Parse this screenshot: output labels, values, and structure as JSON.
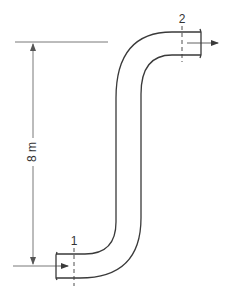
{
  "diagram": {
    "type": "pipe-elevation",
    "elevation_label": "8 m",
    "sections": [
      {
        "id": "inlet",
        "label": "1"
      },
      {
        "id": "outlet",
        "label": "2"
      }
    ],
    "colors": {
      "line": "#3a3a3a",
      "dimension": "#555555",
      "background": "#ffffff"
    }
  }
}
